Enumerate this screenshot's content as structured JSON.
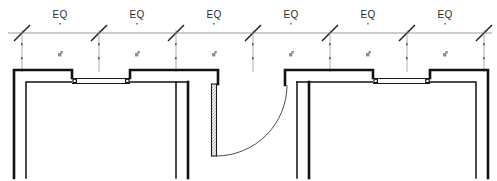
{
  "drawing": {
    "title": "Equal-bay curtain wall elevation plan detail",
    "width": 497,
    "height": 181,
    "background_color": "#ffffff",
    "line_color": "#111111",
    "dimension_color": "#8d8d8d",
    "text_color": "#2b2b2b"
  },
  "dimension_string": {
    "name": "equal-bay-dimension-string",
    "line_y": 33,
    "line_x_start": 8,
    "line_x_end": 492,
    "tick_style": "architectural-slash",
    "tick_positions": [
      22,
      99,
      176,
      253,
      330,
      407,
      484
    ],
    "label_y": 18,
    "labels": [
      {
        "text": "EQ",
        "x": 60
      },
      {
        "text": "EQ",
        "x": 137
      },
      {
        "text": "EQ",
        "x": 214
      },
      {
        "text": "EQ",
        "x": 291
      },
      {
        "text": "EQ",
        "x": 368
      },
      {
        "text": "EQ",
        "x": 445
      }
    ],
    "micro_symbols": [
      {
        "x": 61,
        "y": 56
      },
      {
        "x": 138,
        "y": 56
      },
      {
        "x": 215,
        "y": 56
      },
      {
        "x": 292,
        "y": 56
      },
      {
        "x": 369,
        "y": 56
      },
      {
        "x": 446,
        "y": 56
      }
    ],
    "micro_dots": [
      {
        "x": 60,
        "y": 25
      },
      {
        "x": 137,
        "y": 25
      },
      {
        "x": 214,
        "y": 25
      },
      {
        "x": 291,
        "y": 25
      },
      {
        "x": 368,
        "y": 25
      },
      {
        "x": 445,
        "y": 25
      }
    ],
    "extension_lines": [
      {
        "x": 22,
        "y1": 36,
        "y2": 70
      },
      {
        "x": 99,
        "y1": 36,
        "y2": 70
      },
      {
        "x": 176,
        "y1": 36,
        "y2": 70
      },
      {
        "x": 253,
        "y1": 36,
        "y2": 70
      },
      {
        "x": 330,
        "y1": 36,
        "y2": 70
      },
      {
        "x": 407,
        "y1": 36,
        "y2": 70
      },
      {
        "x": 484,
        "y1": 36,
        "y2": 70
      }
    ],
    "extension_dots": [
      {
        "x": 22,
        "y": 44
      },
      {
        "x": 22,
        "y": 58
      },
      {
        "x": 99,
        "y": 44
      },
      {
        "x": 99,
        "y": 58
      },
      {
        "x": 176,
        "y": 44
      },
      {
        "x": 176,
        "y": 58
      },
      {
        "x": 253,
        "y": 44
      },
      {
        "x": 253,
        "y": 58
      },
      {
        "x": 330,
        "y": 44
      },
      {
        "x": 330,
        "y": 58
      },
      {
        "x": 407,
        "y": 44
      },
      {
        "x": 407,
        "y": 58
      },
      {
        "x": 484,
        "y": 44
      },
      {
        "x": 484,
        "y": 58
      }
    ]
  },
  "plan": {
    "name": "wall-plan-assembly",
    "wall_head_top_y": 70,
    "wall_head_bottom_y": 85,
    "wall_foot_y": 178,
    "piers": [
      {
        "name": "pier-left-end",
        "x": 14,
        "width": 58,
        "type": "L-corner-left"
      },
      {
        "name": "pier-inner-left",
        "x": 130,
        "width": 88,
        "type": "T-junction"
      },
      {
        "name": "pier-inner-right",
        "x": 285,
        "width": 88,
        "type": "T-junction"
      },
      {
        "name": "pier-right-end",
        "x": 430,
        "width": 58,
        "type": "L-corner-right"
      }
    ],
    "glazing_panels": [
      {
        "name": "glazing-panel-left",
        "x_start": 72,
        "x_end": 130,
        "y_top": 78,
        "y_bottom": 85
      },
      {
        "name": "glazing-panel-right",
        "x_start": 373,
        "x_end": 430,
        "y_top": 78,
        "y_bottom": 85
      }
    ],
    "mullion_dots": [
      {
        "x": 75,
        "y": 81
      },
      {
        "x": 127,
        "y": 81
      },
      {
        "x": 376,
        "y": 81
      },
      {
        "x": 427,
        "y": 81
      }
    ],
    "door": {
      "name": "swing-door",
      "leaf_x": 212,
      "leaf_width": 5,
      "leaf_y_top": 84,
      "leaf_y_bottom": 156,
      "hinge_x": 214,
      "hinge_y": 84,
      "swing_radius": 72,
      "swing_direction": "clockwise-right",
      "arc_end_x": 287,
      "arc_end_y": 85
    }
  },
  "legend": {
    "eq_meaning": "EQ",
    "notes": []
  }
}
